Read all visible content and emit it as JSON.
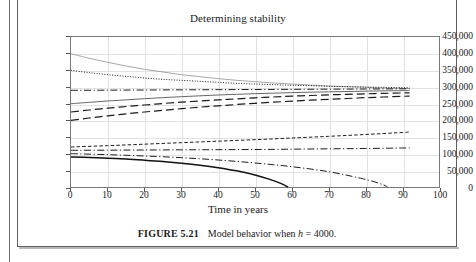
{
  "figure": {
    "caption_label": "FIGURE 5.21",
    "caption_text_a": "Model behavior when",
    "caption_var": "h",
    "caption_text_b": "= 4000."
  },
  "chart_data": {
    "type": "line",
    "title": "Determining stability",
    "xlabel": "Time in years",
    "ylabel": "",
    "xlim": [
      0,
      100
    ],
    "ylim": [
      0,
      450000
    ],
    "xticks": [
      0,
      10,
      20,
      30,
      40,
      50,
      60,
      70,
      80,
      90,
      100
    ],
    "yticks": [
      0,
      50000,
      100000,
      150000,
      200000,
      250000,
      300000,
      350000,
      400000,
      450000
    ],
    "ytick_labels": [
      "0",
      "50,000",
      "100,000",
      "150,000",
      "200,000",
      "250,000",
      "300,000",
      "350,000",
      "400,000",
      "450,000"
    ],
    "xtick_labels": [
      "0",
      "10",
      "20",
      "30",
      "40",
      "50",
      "60",
      "70",
      "80",
      "90",
      "100"
    ],
    "grid": true,
    "legend": "none",
    "equilibrium": 292000,
    "series": [
      {
        "name": "start-400000",
        "style": "solid-thin",
        "color": "#808080",
        "x": [
          0,
          5,
          10,
          15,
          20,
          25,
          30,
          35,
          40,
          45,
          50,
          55,
          60,
          65,
          70,
          75,
          80,
          85,
          90,
          92
        ],
        "y": [
          400000,
          386000,
          374000,
          363000,
          353000,
          345000,
          337000,
          331000,
          325000,
          320000,
          316000,
          312000,
          309000,
          306000,
          303000,
          301000,
          299000,
          297000,
          296000,
          295000
        ]
      },
      {
        "name": "start-350000",
        "style": "dotted",
        "color": "#1a1a1a",
        "x": [
          0,
          5,
          10,
          15,
          20,
          25,
          30,
          35,
          40,
          45,
          50,
          55,
          60,
          65,
          70,
          75,
          80,
          85,
          90,
          92
        ],
        "y": [
          350000,
          343000,
          337000,
          332000,
          327000,
          323000,
          320000,
          317000,
          314000,
          311000,
          309000,
          307000,
          305000,
          304000,
          302000,
          301000,
          300000,
          299000,
          298000,
          298000
        ]
      },
      {
        "name": "start-290000",
        "style": "dash-dot",
        "color": "#1a1a1a",
        "x": [
          0,
          10,
          20,
          30,
          40,
          50,
          60,
          70,
          80,
          90,
          92
        ],
        "y": [
          290000,
          290500,
          291000,
          291500,
          292000,
          292500,
          293000,
          293500,
          294000,
          294500,
          294700
        ]
      },
      {
        "name": "start-250000",
        "style": "solid",
        "color": "#4a4a4a",
        "x": [
          0,
          5,
          10,
          15,
          20,
          25,
          30,
          35,
          40,
          45,
          50,
          55,
          60,
          65,
          70,
          75,
          80,
          85,
          90,
          92
        ],
        "y": [
          250000,
          254000,
          258000,
          261500,
          265000,
          268000,
          271000,
          273500,
          276000,
          278000,
          280000,
          281500,
          283000,
          284500,
          285500,
          286500,
          287500,
          288500,
          289000,
          289500
        ]
      },
      {
        "name": "start-225000",
        "style": "long-dash",
        "color": "#1a1a1a",
        "x": [
          0,
          5,
          10,
          15,
          20,
          25,
          30,
          35,
          40,
          45,
          50,
          55,
          60,
          65,
          70,
          75,
          80,
          85,
          90,
          92
        ],
        "y": [
          225000,
          231000,
          236500,
          241500,
          246000,
          250500,
          254500,
          258000,
          261500,
          264500,
          267500,
          270000,
          272500,
          274500,
          276500,
          278000,
          279500,
          281000,
          282000,
          282500
        ]
      },
      {
        "name": "start-200000",
        "style": "long-dash",
        "color": "#1a1a1a",
        "x": [
          0,
          5,
          10,
          15,
          20,
          25,
          30,
          35,
          40,
          45,
          50,
          55,
          60,
          65,
          70,
          75,
          80,
          85,
          90,
          92
        ],
        "y": [
          200000,
          207000,
          213500,
          219500,
          225000,
          230000,
          235000,
          239500,
          243500,
          247500,
          251000,
          254500,
          257500,
          260500,
          263000,
          265500,
          268000,
          270000,
          272000,
          272500
        ]
      },
      {
        "name": "start-120000",
        "style": "short-dash",
        "color": "#1a1a1a",
        "x": [
          0,
          10,
          20,
          30,
          40,
          50,
          60,
          70,
          80,
          90,
          92
        ],
        "y": [
          120000,
          124000,
          128500,
          133000,
          137500,
          142000,
          147000,
          152000,
          157500,
          163500,
          165000
        ]
      },
      {
        "name": "start-110000",
        "style": "dash-dot",
        "color": "#1a1a1a",
        "x": [
          0,
          10,
          20,
          30,
          40,
          50,
          60,
          70,
          80,
          90,
          92
        ],
        "y": [
          110000,
          110500,
          111000,
          111500,
          112000,
          112500,
          113500,
          114500,
          115500,
          117000,
          117500
        ]
      },
      {
        "name": "start-100000-crash",
        "style": "dash-dot",
        "color": "#1a1a1a",
        "x": [
          0,
          10,
          20,
          30,
          40,
          50,
          60,
          70,
          78,
          82,
          85,
          86
        ],
        "y": [
          100000,
          97000,
          93000,
          88000,
          81000,
          72000,
          61000,
          46000,
          28000,
          17000,
          6000,
          0
        ]
      },
      {
        "name": "start-90000-crash",
        "style": "solid-bold",
        "color": "#111111",
        "x": [
          0,
          5,
          10,
          15,
          20,
          25,
          30,
          35,
          40,
          45,
          50,
          54,
          57,
          59
        ],
        "y": [
          90000,
          88500,
          86500,
          84000,
          80500,
          76500,
          71500,
          65500,
          58000,
          48500,
          36000,
          23000,
          11000,
          0
        ]
      }
    ]
  }
}
